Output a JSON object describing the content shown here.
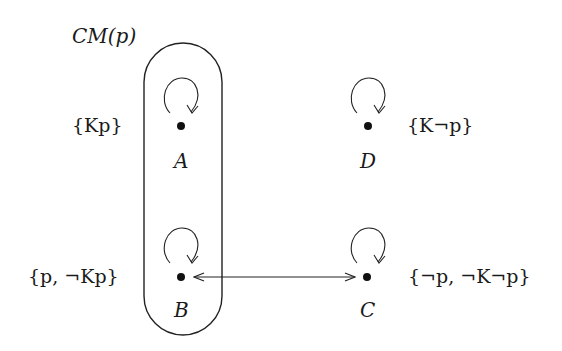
{
  "diagram": {
    "type": "kripke-model",
    "region_label": "CM(p)",
    "nodes": [
      {
        "id": "A",
        "label": "A",
        "valuation": "{Kp}",
        "reflexive": true,
        "in_region": true
      },
      {
        "id": "B",
        "label": "B",
        "valuation": "{p, ¬Kp}",
        "reflexive": true,
        "in_region": true
      },
      {
        "id": "C",
        "label": "C",
        "valuation": "{¬p, ¬K¬p}",
        "reflexive": true,
        "in_region": false
      },
      {
        "id": "D",
        "label": "D",
        "valuation": "{K¬p}",
        "reflexive": true,
        "in_region": false
      }
    ],
    "edges": [
      {
        "from": "B",
        "to": "C",
        "bidirectional": true
      }
    ]
  }
}
